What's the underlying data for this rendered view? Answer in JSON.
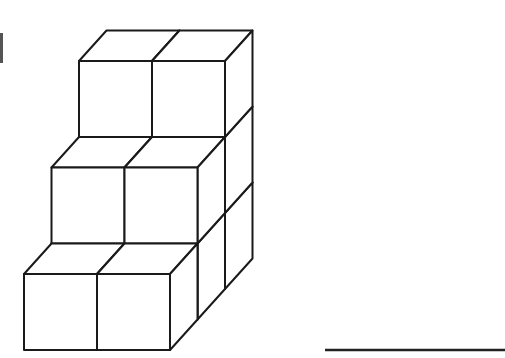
{
  "figure": {
    "layers": [
      {
        "depth": 0,
        "height": 1,
        "width": 2
      },
      {
        "depth": 1,
        "height": 2,
        "width": 2
      },
      {
        "depth": 2,
        "height": 3,
        "width": 2
      }
    ],
    "cube_count": 12,
    "geometry": {
      "origin": [
        24,
        350
      ],
      "cube_w": 73,
      "cube_h": 76,
      "depth_dx": 27.5,
      "depth_dy": -30.5
    },
    "stroke_color": "#1a1a1a"
  },
  "answer_line": {
    "x1": 325,
    "x2": 505,
    "y": 350,
    "value": ""
  }
}
